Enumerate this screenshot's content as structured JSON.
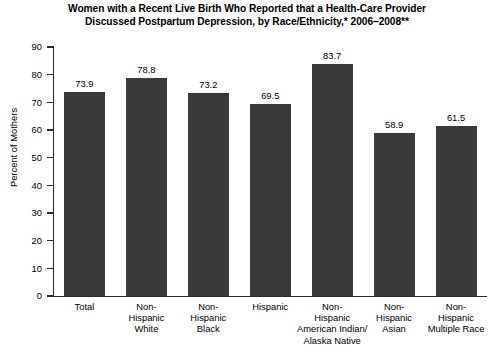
{
  "chart_data": {
    "type": "bar",
    "title": "Women with a Recent Live Birth Who Reported that a Health-Care Provider Discussed Postpartum Depression, by Race/Ethnicity,* 2006–2008**",
    "title_lines": [
      "Women with a Recent Live Birth Who Reported that a Health-Care Provider",
      "Discussed Postpartum Depression, by Race/Ethnicity,* 2006–2008**"
    ],
    "xlabel": "",
    "ylabel": "Percent of Mothers",
    "ylim": [
      0,
      90
    ],
    "ytick_step": 10,
    "yticks": [
      "90",
      "80",
      "70",
      "60",
      "50",
      "40",
      "30",
      "20",
      "10",
      "0"
    ],
    "grid": false,
    "legend": false,
    "bar_color": "#3a3a3a",
    "axis_color": "#2a2a2a",
    "categories": [
      "Total",
      "Non-Hispanic White",
      "Non-Hispanic Black",
      "Hispanic",
      "Non-Hispanic American Indian/ Alaska Native",
      "Non-Hispanic Asian",
      "Non-Hispanic Multiple Race"
    ],
    "category_lines": [
      [
        "Total"
      ],
      [
        "Non-",
        "Hispanic",
        "White"
      ],
      [
        "Non-",
        "Hispanic",
        "Black"
      ],
      [
        "Hispanic"
      ],
      [
        "Non-",
        "Hispanic",
        "American Indian/",
        "Alaska Native"
      ],
      [
        "Non-",
        "Hispanic",
        "Asian"
      ],
      [
        "Non-",
        "Hispanic",
        "Multiple Race"
      ]
    ],
    "values": [
      73.9,
      78.8,
      73.2,
      69.5,
      83.7,
      58.9,
      61.5
    ],
    "value_labels": [
      "73.9",
      "78.8",
      "73.2",
      "69.5",
      "83.7",
      "58.9",
      "61.5"
    ]
  }
}
